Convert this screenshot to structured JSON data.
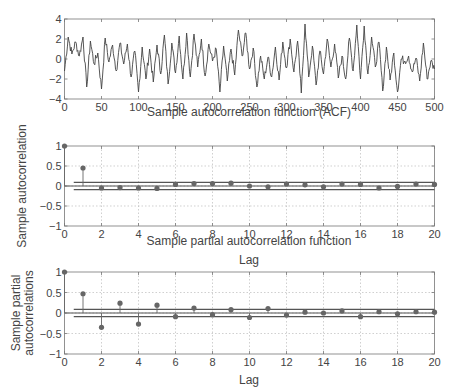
{
  "chart_data": [
    {
      "type": "line",
      "title": "",
      "xlabel": "Sample autocorrelation function (ACF)",
      "ylabel": "",
      "xlim": [
        0,
        500
      ],
      "ylim": [
        -4,
        4
      ],
      "xticks": [
        0,
        50,
        100,
        150,
        200,
        250,
        300,
        350,
        400,
        450,
        500
      ],
      "yticks": [
        -4,
        -2,
        0,
        2,
        4
      ],
      "ytick_labels": [
        "−4",
        "−2",
        "0",
        "2",
        "4"
      ],
      "grid": false,
      "series": [
        {
          "name": "time series",
          "x_step": 5,
          "values": [
            -1.2,
            2.2,
            0.5,
            1.7,
            0.3,
            2.2,
            -2.8,
            1.8,
            -0.5,
            0.6,
            -3.0,
            2.1,
            -0.3,
            1.4,
            -1.2,
            1.6,
            -0.5,
            1.5,
            -1.8,
            0.8,
            -3.3,
            1.2,
            -2.0,
            1.0,
            -2.3,
            1.4,
            -1.5,
            2.4,
            -2.5,
            1.6,
            -1.4,
            2.3,
            -2.0,
            2.6,
            -1.8,
            2.5,
            -0.8,
            2.0,
            -1.7,
            1.5,
            -0.2,
            1.0,
            -3.3,
            1.3,
            -2.2,
            1.0,
            -1.6,
            2.9,
            0.3,
            2.6,
            -1.0,
            1.1,
            -2.8,
            0.3,
            -2.0,
            0.2,
            -1.8,
            1.2,
            -2.1,
            1.7,
            -0.9,
            2.0,
            -1.3,
            1.8,
            -3.4,
            3.5,
            -1.8,
            1.3,
            -2.6,
            0.8,
            -1.5,
            2.0,
            -0.8,
            1.5,
            -1.9,
            0.3,
            -2.0,
            2.1,
            -1.2,
            3.4,
            -2.0,
            3.3,
            -1.5,
            2.2,
            -0.8,
            1.7,
            -3.2,
            1.2,
            -2.1,
            0.6,
            -3.3,
            0.0,
            -0.2,
            0.3,
            -1.3,
            0.1,
            -2.2,
            1.6,
            -2.0,
            -0.2,
            -1.0
          ]
        }
      ]
    },
    {
      "type": "stem",
      "title": "",
      "xlabel": "Sample partial autocorrelation function",
      "ylabel": "Sample autocorrelation",
      "xlim": [
        0,
        20
      ],
      "ylim": [
        -1,
        1
      ],
      "xticks": [
        0,
        2,
        4,
        6,
        8,
        10,
        12,
        14,
        16,
        18,
        20
      ],
      "yticks": [
        -1,
        -0.5,
        0,
        0.5,
        1
      ],
      "ytick_labels": [
        "−1",
        "−0.5",
        "0",
        "0.5",
        "1"
      ],
      "grid": true,
      "confidence_bounds": [
        -0.09,
        0.09
      ],
      "x": [
        0,
        1,
        2,
        3,
        4,
        5,
        6,
        7,
        8,
        9,
        10,
        11,
        12,
        13,
        14,
        15,
        16,
        17,
        18,
        19,
        20
      ],
      "values": [
        1.0,
        0.45,
        -0.05,
        -0.04,
        -0.05,
        -0.06,
        0.04,
        0.06,
        0.06,
        0.07,
        0.0,
        -0.02,
        0.05,
        0.03,
        -0.02,
        0.05,
        0.04,
        -0.05,
        -0.01,
        0.05,
        0.04
      ]
    },
    {
      "type": "stem",
      "title": "",
      "xlabel": "Lag",
      "ylabel": "Sample partial autocorrelations",
      "xlim": [
        0,
        20
      ],
      "ylim": [
        -1,
        1
      ],
      "xticks": [
        0,
        2,
        4,
        6,
        8,
        10,
        12,
        14,
        16,
        18,
        20
      ],
      "yticks": [
        -1,
        -0.5,
        0,
        0.5,
        1
      ],
      "ytick_labels": [
        "−1",
        "−0.5",
        "0",
        "0.5",
        "1"
      ],
      "grid": true,
      "confidence_bounds": [
        -0.09,
        0.09
      ],
      "x": [
        0,
        1,
        2,
        3,
        4,
        5,
        6,
        7,
        8,
        9,
        10,
        11,
        12,
        13,
        14,
        15,
        16,
        17,
        18,
        19,
        20
      ],
      "values": [
        1.0,
        0.47,
        -0.35,
        0.24,
        -0.27,
        0.19,
        -0.09,
        0.12,
        -0.04,
        0.08,
        -0.11,
        0.11,
        -0.05,
        0.02,
        0.0,
        0.05,
        -0.09,
        0.03,
        -0.02,
        0.03,
        0.02
      ]
    }
  ],
  "labels": {
    "acf_title": "Sample autocorrelation function (ACF)",
    "acf_ylabel": "Sample autocorrelation",
    "acf_xlabel": "Lag",
    "pacf_title": "Sample partial autocorrelation function",
    "pacf_ylabel_line1": "Sample partial",
    "pacf_ylabel_line2": "autocorrelations",
    "pacf_xlabel": "Lag"
  }
}
